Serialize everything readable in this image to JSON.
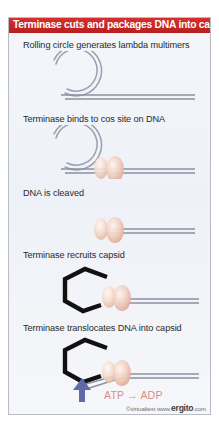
{
  "figure": {
    "title": "Terminase cuts and packages DNA into capsid",
    "title_bar_color": "#c42625",
    "title_text_color": "#ffffff",
    "background_color": "#eef1f7",
    "border_color": "#b9bcc4",
    "dna_color": "#7d8396",
    "terminase_color": "#e8b8a8",
    "capsid_color": "#111111",
    "arrow_color": "#5f6aa8",
    "atp_text_color": "#d98b86"
  },
  "steps": [
    {
      "id": "step-1",
      "label": "Rolling circle generates lambda multimers",
      "art": "rolling-circle-with-tail"
    },
    {
      "id": "step-2",
      "label": "Terminase binds to cos site on DNA",
      "art": "circle-with-terminase-on-dna"
    },
    {
      "id": "step-3",
      "label": "DNA is cleaved",
      "art": "terminase-on-linear-dna"
    },
    {
      "id": "step-4",
      "label": "Terminase recruits capsid",
      "art": "capsid-terminase-dna"
    },
    {
      "id": "step-5",
      "label": "Terminase translocates DNA into capsid",
      "art": "capsid-packaging-dna-with-atp-arrow"
    }
  ],
  "annotations": {
    "atp_reaction": "ATP → ADP"
  },
  "credit": {
    "copyright": "©virtualtext  www.",
    "brand": "ergito",
    "tld": ".com"
  }
}
